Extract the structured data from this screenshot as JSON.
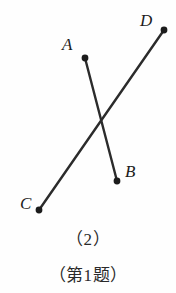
{
  "figure": {
    "type": "geometry-line-diagram",
    "background_color": "#fefefe",
    "stroke_color": "#2b2b2b",
    "stroke_width": 2.4,
    "dot_color": "#1c1c1c",
    "dot_radius": 3.2,
    "points": [
      {
        "id": "A",
        "label": "A",
        "x": 85,
        "y": 58
      },
      {
        "id": "B",
        "label": "B",
        "x": 117,
        "y": 181
      },
      {
        "id": "C",
        "label": "C",
        "x": 39,
        "y": 210
      },
      {
        "id": "D",
        "label": "D",
        "x": 164,
        "y": 30
      }
    ],
    "segments": [
      {
        "id": "AB",
        "from": "A",
        "to": "B"
      },
      {
        "id": "CD",
        "from": "C",
        "to": "D"
      }
    ],
    "intersection": {
      "x": 101,
      "y": 122
    }
  },
  "captions": {
    "number": "（2）",
    "title": "（第1题）"
  }
}
